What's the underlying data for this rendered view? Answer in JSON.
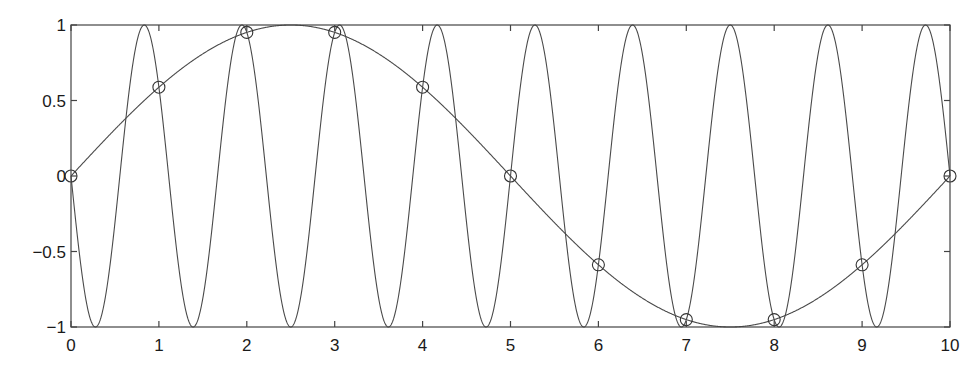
{
  "chart_data": {
    "type": "line",
    "title": "",
    "xlabel": "",
    "ylabel": "",
    "xlim": [
      0,
      10
    ],
    "ylim": [
      -1,
      1
    ],
    "grid": false,
    "legend": null,
    "x_ticks": [
      0,
      1,
      2,
      3,
      4,
      5,
      6,
      7,
      8,
      9,
      10
    ],
    "x_tick_labels": [
      "0",
      "1",
      "2",
      "3",
      "4",
      "5",
      "6",
      "7",
      "8",
      "9",
      "10"
    ],
    "y_ticks": [
      1,
      0.5,
      0,
      -0.5,
      -1
    ],
    "y_tick_labels": [
      "1",
      "0.5",
      "0",
      "−0.5",
      "−1"
    ],
    "series": [
      {
        "name": "fast sinusoid",
        "style": "line",
        "expression": "-sin(1.8*pi*x)",
        "frequency": 0.9,
        "color": "#4a4a4a",
        "x": [
          0,
          0.05,
          0.1,
          0.15,
          0.2,
          0.25,
          0.3,
          0.35,
          0.4,
          0.45,
          0.5,
          0.55,
          0.6,
          0.65,
          0.7,
          0.75,
          0.8,
          0.85,
          0.9,
          0.95,
          1.0
        ],
        "values": [
          0,
          -0.279,
          -0.536,
          -0.749,
          -0.905,
          -0.988,
          -0.992,
          -0.918,
          -0.771,
          -0.562,
          -0.309,
          -0.031,
          0.249,
          0.509,
          0.727,
          0.891,
          0.982,
          0.996,
          0.951,
          0.818,
          0.588
        ]
      },
      {
        "name": "slow sinusoid",
        "style": "line",
        "expression": "sin(0.2*pi*x)",
        "frequency": 0.1,
        "color": "#4a4a4a",
        "x": [
          0,
          1,
          2,
          3,
          4,
          5,
          6,
          7,
          8,
          9,
          10
        ],
        "values": [
          0,
          0.588,
          0.951,
          0.951,
          0.588,
          0,
          -0.588,
          -0.951,
          -0.951,
          -0.588,
          0
        ]
      },
      {
        "name": "samples",
        "style": "markers",
        "marker": "circle",
        "color": "#333333",
        "x": [
          0,
          1,
          2,
          3,
          4,
          5,
          6,
          7,
          8,
          9,
          10
        ],
        "values": [
          0,
          0.588,
          0.951,
          0.951,
          0.588,
          0,
          -0.588,
          -0.951,
          -0.951,
          -0.588,
          0
        ]
      }
    ]
  },
  "plot_box": {
    "left": 71,
    "top": 25,
    "right": 950,
    "bottom": 327
  }
}
